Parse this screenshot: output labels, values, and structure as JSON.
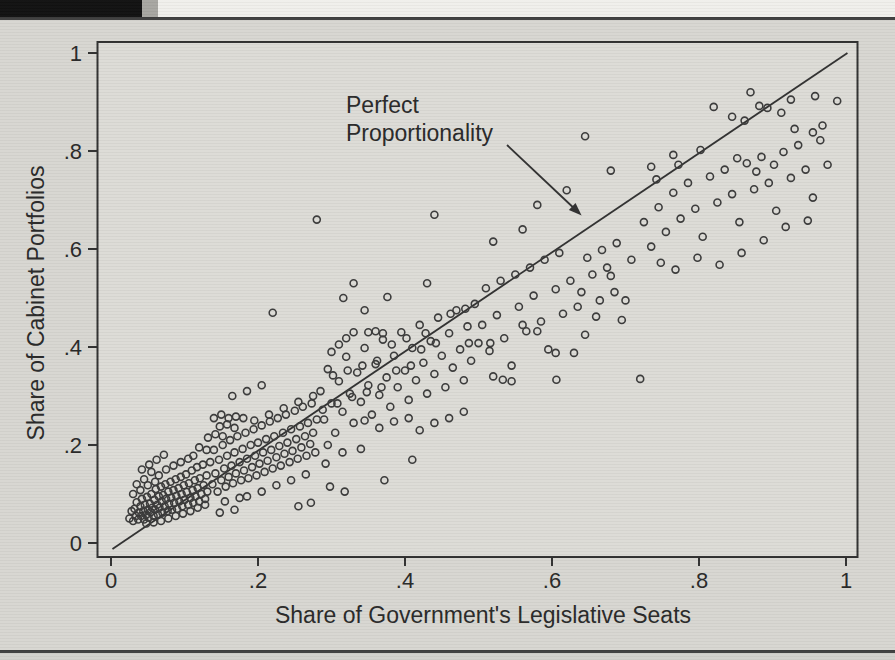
{
  "colors": {
    "page": "#d7d6d1",
    "plot_background": "#dcdbd6",
    "ink": "#2e2e2e",
    "text": "#262626",
    "top_band": "#f0efeb",
    "black_bar": "#0e0e0e",
    "bar_edge": "#a6a5a0",
    "rule": "#3c3c3c",
    "below_rule": "#d1d0cb"
  },
  "chart_data": {
    "type": "scatter",
    "title": "",
    "xlabel": "Share of Government's Legislative Seats",
    "ylabel": "Share of Cabinet Portfolios",
    "xlim": [
      0,
      1
    ],
    "ylim": [
      0,
      1
    ],
    "grid": false,
    "tick_values": [
      0,
      0.2,
      0.4,
      0.6,
      0.8,
      1
    ],
    "x_tick_labels": [
      "0",
      ".2",
      ".4",
      ".6",
      ".8",
      "1"
    ],
    "y_tick_labels": [
      "0",
      ".2",
      ".4",
      ".6",
      ".8",
      "1"
    ],
    "annotation": {
      "line1": "Perfect",
      "line2": "Proportionality"
    },
    "reference_line": {
      "from": [
        0.002,
        -0.012
      ],
      "to": [
        1.002,
        1.0
      ],
      "meaning": "y = x (perfect proportionality)"
    },
    "marker": {
      "shape": "open-circle",
      "radius_px": 3.5
    },
    "points": [
      [
        0.025,
        0.05
      ],
      [
        0.028,
        0.065
      ],
      [
        0.03,
        0.045
      ],
      [
        0.032,
        0.07
      ],
      [
        0.034,
        0.055
      ],
      [
        0.035,
        0.083
      ],
      [
        0.037,
        0.048
      ],
      [
        0.038,
        0.062
      ],
      [
        0.04,
        0.075
      ],
      [
        0.041,
        0.055
      ],
      [
        0.042,
        0.09
      ],
      [
        0.044,
        0.065
      ],
      [
        0.045,
        0.048
      ],
      [
        0.046,
        0.078
      ],
      [
        0.048,
        0.058
      ],
      [
        0.049,
        0.094
      ],
      [
        0.05,
        0.068
      ],
      [
        0.051,
        0.052
      ],
      [
        0.053,
        0.08
      ],
      [
        0.054,
        0.063
      ],
      [
        0.055,
        0.1
      ],
      [
        0.056,
        0.072
      ],
      [
        0.058,
        0.055
      ],
      [
        0.059,
        0.088
      ],
      [
        0.06,
        0.068
      ],
      [
        0.061,
        0.11
      ],
      [
        0.063,
        0.078
      ],
      [
        0.064,
        0.058
      ],
      [
        0.065,
        0.095
      ],
      [
        0.066,
        0.072
      ],
      [
        0.068,
        0.115
      ],
      [
        0.069,
        0.085
      ],
      [
        0.07,
        0.062
      ],
      [
        0.071,
        0.098
      ],
      [
        0.073,
        0.075
      ],
      [
        0.074,
        0.12
      ],
      [
        0.075,
        0.09
      ],
      [
        0.077,
        0.065
      ],
      [
        0.078,
        0.105
      ],
      [
        0.079,
        0.08
      ],
      [
        0.081,
        0.125
      ],
      [
        0.082,
        0.092
      ],
      [
        0.083,
        0.068
      ],
      [
        0.085,
        0.108
      ],
      [
        0.086,
        0.082
      ],
      [
        0.088,
        0.13
      ],
      [
        0.089,
        0.096
      ],
      [
        0.09,
        0.07
      ],
      [
        0.092,
        0.112
      ],
      [
        0.093,
        0.085
      ],
      [
        0.095,
        0.135
      ],
      [
        0.096,
        0.1
      ],
      [
        0.097,
        0.075
      ],
      [
        0.099,
        0.118
      ],
      [
        0.1,
        0.088
      ],
      [
        0.102,
        0.14
      ],
      [
        0.103,
        0.104
      ],
      [
        0.105,
        0.078
      ],
      [
        0.106,
        0.122
      ],
      [
        0.108,
        0.092
      ],
      [
        0.11,
        0.148
      ],
      [
        0.111,
        0.108
      ],
      [
        0.112,
        0.082
      ],
      [
        0.114,
        0.128
      ],
      [
        0.115,
        0.095
      ],
      [
        0.117,
        0.155
      ],
      [
        0.118,
        0.112
      ],
      [
        0.12,
        0.085
      ],
      [
        0.121,
        0.132
      ],
      [
        0.123,
        0.1
      ],
      [
        0.125,
        0.16
      ],
      [
        0.126,
        0.118
      ],
      [
        0.128,
        0.09
      ],
      [
        0.13,
        0.138
      ],
      [
        0.131,
        0.105
      ],
      [
        0.048,
        0.04
      ],
      [
        0.058,
        0.042
      ],
      [
        0.068,
        0.045
      ],
      [
        0.078,
        0.05
      ],
      [
        0.088,
        0.055
      ],
      [
        0.098,
        0.06
      ],
      [
        0.108,
        0.065
      ],
      [
        0.118,
        0.072
      ],
      [
        0.128,
        0.078
      ],
      [
        0.03,
        0.1
      ],
      [
        0.04,
        0.108
      ],
      [
        0.05,
        0.118
      ],
      [
        0.06,
        0.125
      ],
      [
        0.035,
        0.12
      ],
      [
        0.045,
        0.13
      ],
      [
        0.055,
        0.145
      ],
      [
        0.065,
        0.138
      ],
      [
        0.075,
        0.15
      ],
      [
        0.085,
        0.158
      ],
      [
        0.095,
        0.165
      ],
      [
        0.105,
        0.172
      ],
      [
        0.042,
        0.15
      ],
      [
        0.052,
        0.16
      ],
      [
        0.062,
        0.17
      ],
      [
        0.072,
        0.18
      ],
      [
        0.135,
        0.165
      ],
      [
        0.138,
        0.12
      ],
      [
        0.14,
        0.19
      ],
      [
        0.142,
        0.142
      ],
      [
        0.145,
        0.105
      ],
      [
        0.147,
        0.17
      ],
      [
        0.15,
        0.128
      ],
      [
        0.152,
        0.2
      ],
      [
        0.154,
        0.152
      ],
      [
        0.156,
        0.115
      ],
      [
        0.158,
        0.178
      ],
      [
        0.16,
        0.135
      ],
      [
        0.162,
        0.21
      ],
      [
        0.164,
        0.158
      ],
      [
        0.166,
        0.122
      ],
      [
        0.168,
        0.185
      ],
      [
        0.17,
        0.142
      ],
      [
        0.172,
        0.218
      ],
      [
        0.175,
        0.165
      ],
      [
        0.177,
        0.128
      ],
      [
        0.179,
        0.192
      ],
      [
        0.181,
        0.148
      ],
      [
        0.183,
        0.225
      ],
      [
        0.185,
        0.172
      ],
      [
        0.187,
        0.132
      ],
      [
        0.19,
        0.2
      ],
      [
        0.192,
        0.155
      ],
      [
        0.194,
        0.232
      ],
      [
        0.196,
        0.178
      ],
      [
        0.198,
        0.138
      ],
      [
        0.2,
        0.205
      ],
      [
        0.202,
        0.162
      ],
      [
        0.205,
        0.24
      ],
      [
        0.207,
        0.185
      ],
      [
        0.209,
        0.145
      ],
      [
        0.211,
        0.212
      ],
      [
        0.213,
        0.168
      ],
      [
        0.216,
        0.248
      ],
      [
        0.218,
        0.19
      ],
      [
        0.22,
        0.152
      ],
      [
        0.222,
        0.218
      ],
      [
        0.225,
        0.175
      ],
      [
        0.227,
        0.255
      ],
      [
        0.229,
        0.198
      ],
      [
        0.231,
        0.158
      ],
      [
        0.234,
        0.225
      ],
      [
        0.236,
        0.182
      ],
      [
        0.238,
        0.262
      ],
      [
        0.24,
        0.205
      ],
      [
        0.243,
        0.165
      ],
      [
        0.245,
        0.232
      ],
      [
        0.247,
        0.188
      ],
      [
        0.25,
        0.27
      ],
      [
        0.252,
        0.212
      ],
      [
        0.254,
        0.172
      ],
      [
        0.257,
        0.238
      ],
      [
        0.259,
        0.195
      ],
      [
        0.261,
        0.278
      ],
      [
        0.264,
        0.218
      ],
      [
        0.266,
        0.178
      ],
      [
        0.268,
        0.245
      ],
      [
        0.271,
        0.202
      ],
      [
        0.273,
        0.285
      ],
      [
        0.275,
        0.225
      ],
      [
        0.278,
        0.185
      ],
      [
        0.28,
        0.252
      ],
      [
        0.14,
        0.255
      ],
      [
        0.15,
        0.262
      ],
      [
        0.16,
        0.255
      ],
      [
        0.17,
        0.258
      ],
      [
        0.18,
        0.255
      ],
      [
        0.148,
        0.238
      ],
      [
        0.158,
        0.242
      ],
      [
        0.168,
        0.235
      ],
      [
        0.132,
        0.215
      ],
      [
        0.142,
        0.222
      ],
      [
        0.152,
        0.218
      ],
      [
        0.12,
        0.195
      ],
      [
        0.13,
        0.19
      ],
      [
        0.112,
        0.178
      ],
      [
        0.185,
        0.095
      ],
      [
        0.205,
        0.105
      ],
      [
        0.225,
        0.118
      ],
      [
        0.245,
        0.128
      ],
      [
        0.265,
        0.14
      ],
      [
        0.155,
        0.085
      ],
      [
        0.175,
        0.092
      ],
      [
        0.195,
        0.25
      ],
      [
        0.215,
        0.262
      ],
      [
        0.235,
        0.275
      ],
      [
        0.255,
        0.288
      ],
      [
        0.275,
        0.3
      ],
      [
        0.165,
        0.3
      ],
      [
        0.185,
        0.31
      ],
      [
        0.205,
        0.322
      ],
      [
        0.148,
        0.062
      ],
      [
        0.168,
        0.068
      ],
      [
        0.255,
        0.075
      ],
      [
        0.272,
        0.082
      ],
      [
        0.292,
        0.162
      ],
      [
        0.285,
        0.31
      ],
      [
        0.29,
        0.252
      ],
      [
        0.295,
        0.355
      ],
      [
        0.3,
        0.285
      ],
      [
        0.305,
        0.225
      ],
      [
        0.31,
        0.33
      ],
      [
        0.315,
        0.268
      ],
      [
        0.32,
        0.38
      ],
      [
        0.325,
        0.305
      ],
      [
        0.33,
        0.245
      ],
      [
        0.335,
        0.348
      ],
      [
        0.34,
        0.288
      ],
      [
        0.345,
        0.398
      ],
      [
        0.35,
        0.322
      ],
      [
        0.355,
        0.262
      ],
      [
        0.36,
        0.365
      ],
      [
        0.365,
        0.302
      ],
      [
        0.37,
        0.415
      ],
      [
        0.375,
        0.338
      ],
      [
        0.38,
        0.278
      ],
      [
        0.385,
        0.382
      ],
      [
        0.39,
        0.318
      ],
      [
        0.395,
        0.43
      ],
      [
        0.4,
        0.352
      ],
      [
        0.405,
        0.292
      ],
      [
        0.41,
        0.398
      ],
      [
        0.415,
        0.332
      ],
      [
        0.42,
        0.445
      ],
      [
        0.425,
        0.368
      ],
      [
        0.43,
        0.305
      ],
      [
        0.435,
        0.412
      ],
      [
        0.44,
        0.345
      ],
      [
        0.445,
        0.46
      ],
      [
        0.45,
        0.382
      ],
      [
        0.455,
        0.318
      ],
      [
        0.46,
        0.428
      ],
      [
        0.465,
        0.358
      ],
      [
        0.47,
        0.475
      ],
      [
        0.475,
        0.395
      ],
      [
        0.48,
        0.332
      ],
      [
        0.485,
        0.442
      ],
      [
        0.49,
        0.372
      ],
      [
        0.495,
        0.488
      ],
      [
        0.5,
        0.408
      ],
      [
        0.35,
        0.43
      ],
      [
        0.36,
        0.432
      ],
      [
        0.37,
        0.428
      ],
      [
        0.345,
        0.25
      ],
      [
        0.365,
        0.235
      ],
      [
        0.385,
        0.248
      ],
      [
        0.405,
        0.255
      ],
      [
        0.3,
        0.39
      ],
      [
        0.31,
        0.405
      ],
      [
        0.32,
        0.418
      ],
      [
        0.295,
        0.2
      ],
      [
        0.315,
        0.185
      ],
      [
        0.33,
        0.43
      ],
      [
        0.34,
        0.192
      ],
      [
        0.42,
        0.23
      ],
      [
        0.44,
        0.245
      ],
      [
        0.46,
        0.255
      ],
      [
        0.48,
        0.268
      ],
      [
        0.302,
        0.342
      ],
      [
        0.322,
        0.352
      ],
      [
        0.342,
        0.362
      ],
      [
        0.362,
        0.372
      ],
      [
        0.382,
        0.405
      ],
      [
        0.402,
        0.418
      ],
      [
        0.422,
        0.395
      ],
      [
        0.442,
        0.408
      ],
      [
        0.462,
        0.468
      ],
      [
        0.482,
        0.478
      ],
      [
        0.288,
        0.272
      ],
      [
        0.308,
        0.285
      ],
      [
        0.328,
        0.298
      ],
      [
        0.348,
        0.308
      ],
      [
        0.368,
        0.318
      ],
      [
        0.388,
        0.352
      ],
      [
        0.408,
        0.362
      ],
      [
        0.428,
        0.428
      ],
      [
        0.505,
        0.445
      ],
      [
        0.515,
        0.392
      ],
      [
        0.525,
        0.465
      ],
      [
        0.535,
        0.418
      ],
      [
        0.545,
        0.362
      ],
      [
        0.555,
        0.482
      ],
      [
        0.565,
        0.432
      ],
      [
        0.575,
        0.505
      ],
      [
        0.585,
        0.452
      ],
      [
        0.595,
        0.395
      ],
      [
        0.605,
        0.518
      ],
      [
        0.615,
        0.468
      ],
      [
        0.625,
        0.535
      ],
      [
        0.635,
        0.482
      ],
      [
        0.645,
        0.425
      ],
      [
        0.655,
        0.548
      ],
      [
        0.665,
        0.495
      ],
      [
        0.675,
        0.562
      ],
      [
        0.685,
        0.512
      ],
      [
        0.695,
        0.455
      ],
      [
        0.51,
        0.52
      ],
      [
        0.53,
        0.535
      ],
      [
        0.55,
        0.548
      ],
      [
        0.57,
        0.562
      ],
      [
        0.59,
        0.578
      ],
      [
        0.61,
        0.592
      ],
      [
        0.52,
        0.34
      ],
      [
        0.545,
        0.33
      ],
      [
        0.605,
        0.388
      ],
      [
        0.63,
        0.388
      ],
      [
        0.487,
        0.408
      ],
      [
        0.516,
        0.408
      ],
      [
        0.56,
        0.445
      ],
      [
        0.58,
        0.432
      ],
      [
        0.64,
        0.512
      ],
      [
        0.66,
        0.462
      ],
      [
        0.68,
        0.545
      ],
      [
        0.7,
        0.495
      ],
      [
        0.72,
        0.335
      ],
      [
        0.533,
        0.333
      ],
      [
        0.606,
        0.333
      ],
      [
        0.648,
        0.582
      ],
      [
        0.668,
        0.598
      ],
      [
        0.688,
        0.612
      ],
      [
        0.708,
        0.578
      ],
      [
        0.725,
        0.655
      ],
      [
        0.735,
        0.605
      ],
      [
        0.745,
        0.685
      ],
      [
        0.755,
        0.635
      ],
      [
        0.765,
        0.715
      ],
      [
        0.775,
        0.662
      ],
      [
        0.785,
        0.735
      ],
      [
        0.795,
        0.682
      ],
      [
        0.805,
        0.625
      ],
      [
        0.815,
        0.748
      ],
      [
        0.825,
        0.695
      ],
      [
        0.835,
        0.762
      ],
      [
        0.845,
        0.712
      ],
      [
        0.855,
        0.655
      ],
      [
        0.865,
        0.775
      ],
      [
        0.875,
        0.722
      ],
      [
        0.885,
        0.788
      ],
      [
        0.895,
        0.735
      ],
      [
        0.905,
        0.678
      ],
      [
        0.915,
        0.798
      ],
      [
        0.925,
        0.745
      ],
      [
        0.935,
        0.812
      ],
      [
        0.945,
        0.762
      ],
      [
        0.955,
        0.705
      ],
      [
        0.965,
        0.822
      ],
      [
        0.975,
        0.772
      ],
      [
        0.742,
        0.742
      ],
      [
        0.772,
        0.772
      ],
      [
        0.802,
        0.802
      ],
      [
        0.862,
        0.862
      ],
      [
        0.87,
        0.92
      ],
      [
        0.82,
        0.89
      ],
      [
        0.845,
        0.87
      ],
      [
        0.882,
        0.892
      ],
      [
        0.893,
        0.888
      ],
      [
        0.912,
        0.878
      ],
      [
        0.93,
        0.845
      ],
      [
        0.955,
        0.838
      ],
      [
        0.968,
        0.852
      ],
      [
        0.748,
        0.572
      ],
      [
        0.768,
        0.558
      ],
      [
        0.798,
        0.582
      ],
      [
        0.828,
        0.568
      ],
      [
        0.858,
        0.592
      ],
      [
        0.888,
        0.618
      ],
      [
        0.918,
        0.645
      ],
      [
        0.948,
        0.658
      ],
      [
        0.735,
        0.768
      ],
      [
        0.765,
        0.792
      ],
      [
        0.925,
        0.905
      ],
      [
        0.958,
        0.912
      ],
      [
        0.852,
        0.785
      ],
      [
        0.878,
        0.758
      ],
      [
        0.902,
        0.772
      ],
      [
        0.988,
        0.902
      ],
      [
        0.28,
        0.66
      ],
      [
        0.44,
        0.67
      ],
      [
        0.33,
        0.53
      ],
      [
        0.376,
        0.502
      ],
      [
        0.43,
        0.53
      ],
      [
        0.316,
        0.5
      ],
      [
        0.345,
        0.475
      ],
      [
        0.22,
        0.47
      ],
      [
        0.645,
        0.83
      ],
      [
        0.68,
        0.76
      ],
      [
        0.58,
        0.69
      ],
      [
        0.62,
        0.72
      ],
      [
        0.52,
        0.615
      ],
      [
        0.56,
        0.64
      ],
      [
        0.298,
        0.115
      ],
      [
        0.318,
        0.105
      ],
      [
        0.41,
        0.17
      ],
      [
        0.372,
        0.128
      ]
    ]
  }
}
